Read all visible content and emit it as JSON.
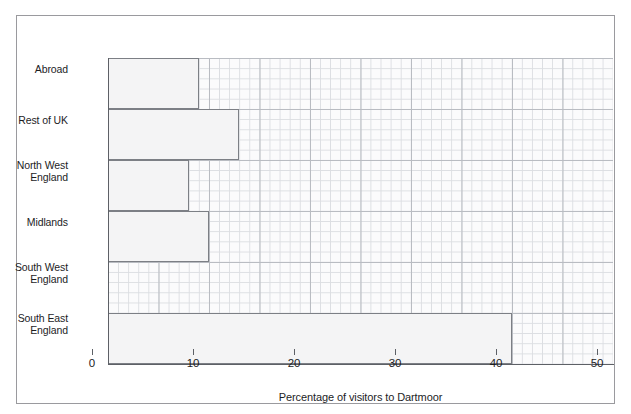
{
  "chart_data": {
    "type": "bar",
    "orientation": "horizontal",
    "title": "",
    "subtitle": "",
    "xlabel": "Percentage of visitors to Dartmoor",
    "ylabel": "",
    "categories": [
      "Abroad",
      "Rest of UK",
      "North West\nEngland",
      "Midlands",
      "South West\nEngland",
      "South East\nEngland"
    ],
    "category_lines": [
      [
        "Abroad"
      ],
      [
        "Rest of UK"
      ],
      [
        "North West",
        "England"
      ],
      [
        "Midlands"
      ],
      [
        "South West",
        "England"
      ],
      [
        "South East",
        "England"
      ]
    ],
    "values": [
      9,
      13,
      8,
      10,
      0,
      40
    ],
    "xlim": [
      0,
      50
    ],
    "xticks": [
      0,
      10,
      20,
      30,
      40,
      50
    ],
    "xtick_labels": [
      "0",
      "10",
      "20",
      "30",
      "40",
      "50"
    ],
    "grid": true,
    "grid_style": "fine mesh, minor every 1 unit, major every 5 units",
    "legend": null,
    "legend_position": "none",
    "bar_fill_color": "#f4f4f5",
    "bar_border_color": "#7c7f85",
    "axis_color": "#5d6066",
    "grid_minor_color": "#dcdee2",
    "grid_major_color": "#b9bcc2",
    "plot_background_color": "#fbfbfc",
    "figure_border_color": "#9a9a9e",
    "text_color": "#1d1d1f"
  }
}
